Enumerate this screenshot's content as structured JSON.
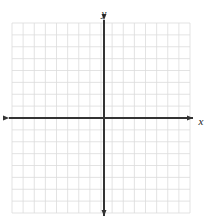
{
  "figure": {
    "name": "blank-cartesian-coordinate-grid",
    "width": 209,
    "height": 222,
    "background_color": "#ffffff"
  },
  "chart_data": {
    "type": "scatter",
    "title": "",
    "subtitle": "",
    "xlabel": "x",
    "ylabel": "y",
    "x": [],
    "values": [],
    "series": [],
    "annotations": [],
    "legend": null,
    "legend_position": "none",
    "grid": true,
    "xlim": [
      -8,
      8
    ],
    "ylim": [
      -8,
      8
    ],
    "xticks": [
      -8,
      -7,
      -6,
      -5,
      -4,
      -3,
      -2,
      -1,
      0,
      1,
      2,
      3,
      4,
      5,
      6,
      7,
      8
    ],
    "yticks": [
      -8,
      -7,
      -6,
      -5,
      -4,
      -3,
      -2,
      -1,
      0,
      1,
      2,
      3,
      4,
      5,
      6,
      7,
      8
    ],
    "xtick_labels": [],
    "ytick_labels": []
  },
  "grid": {
    "columns": 16,
    "rows": 16,
    "left": 12,
    "top": 23,
    "right": 190,
    "bottom": 213,
    "cell_width": 11.125,
    "cell_height": 11.875,
    "line_color": "#dcdcdc",
    "line_width": 0.8
  },
  "axes": {
    "color": "#333333",
    "line_width": 2,
    "origin_x": 104,
    "origin_y": 118,
    "x_axis": {
      "start": 9,
      "end": 193,
      "label": "x",
      "label_x": 201,
      "label_y": 122
    },
    "y_axis": {
      "start": 20,
      "end": 216,
      "label": "y",
      "label_x": 104,
      "label_y": 14
    },
    "arrowheads": [
      "left",
      "right",
      "up",
      "down"
    ]
  }
}
